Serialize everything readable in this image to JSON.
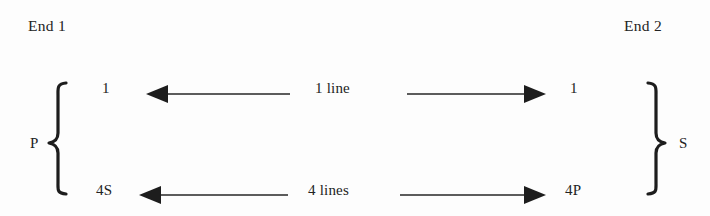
{
  "figure": {
    "title_end1": "End 1",
    "title_end2": "End 2",
    "ink_color": "#1d1d1d",
    "background_color": "#fdfdfd"
  },
  "groups": {
    "left": {
      "label": "P",
      "brace": "left-curly-brace"
    },
    "right": {
      "label": "S",
      "brace": "right-curly-brace"
    }
  },
  "rows": [
    {
      "id": "row-top",
      "left_endpoint": "1",
      "right_endpoint": "1",
      "center_label": "1 line",
      "left_arrow_direction": "left",
      "right_arrow_direction": "right"
    },
    {
      "id": "row-bottom",
      "left_endpoint": "4S",
      "right_endpoint": "4P",
      "center_label": "4 lines",
      "left_arrow_direction": "left",
      "right_arrow_direction": "right"
    }
  ]
}
